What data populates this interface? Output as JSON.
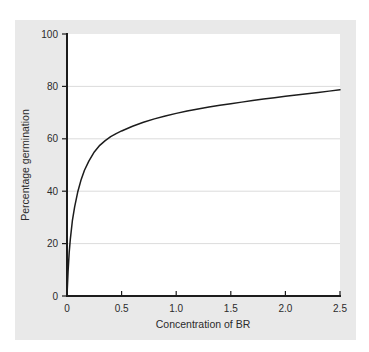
{
  "figure": {
    "background_color": "#e9e9e9",
    "plot_background_color": "#ffffff",
    "curve_color": "#1c1c1c",
    "gridline_color": "#d2d2d2",
    "axis_color": "#1c1c1c"
  },
  "chart_data": {
    "type": "line",
    "title": "",
    "subtitle": "",
    "xlabel": "Concentration of BR",
    "ylabel": "Percentage germination",
    "xlim": [
      0,
      2.5
    ],
    "ylim": [
      0,
      100
    ],
    "xticks": [
      0,
      0.5,
      1.0,
      1.5,
      2.0,
      2.5
    ],
    "xticklabels": [
      "0",
      "0.5",
      "1.0",
      "1.5",
      "2.0",
      "2.5"
    ],
    "yticks": [
      0,
      20,
      40,
      60,
      80,
      100
    ],
    "yticklabels": [
      "0",
      "20",
      "40",
      "60",
      "80",
      "100"
    ],
    "grid": "horizontal",
    "legend": "none",
    "annotations": [],
    "series": [
      {
        "name": "Percentage germination",
        "x": [
          0,
          0.01,
          0.02,
          0.03,
          0.05,
          0.07,
          0.1,
          0.13,
          0.16,
          0.2,
          0.25,
          0.3,
          0.35,
          0.4,
          0.45,
          0.5,
          0.6,
          0.7,
          0.8,
          0.9,
          1.0,
          1.1,
          1.2,
          1.3,
          1.4,
          1.5,
          1.6,
          1.7,
          1.8,
          1.9,
          2.0,
          2.1,
          2.2,
          2.3,
          2.4,
          2.5
        ],
        "values": [
          0,
          9.5,
          16.5,
          21.5,
          29.0,
          34.0,
          40.0,
          44.5,
          48.0,
          51.5,
          55.0,
          57.5,
          59.3,
          60.8,
          62.0,
          63.0,
          64.8,
          66.3,
          67.6,
          68.7,
          69.7,
          70.6,
          71.4,
          72.1,
          72.8,
          73.4,
          74.0,
          74.6,
          75.2,
          75.7,
          76.2,
          76.7,
          77.2,
          77.7,
          78.2,
          78.7
        ]
      }
    ]
  }
}
